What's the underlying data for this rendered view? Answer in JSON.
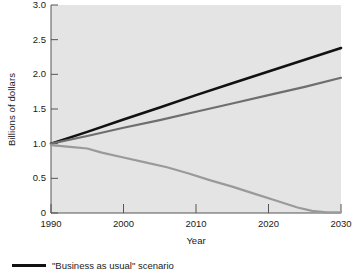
{
  "chart_data": {
    "type": "line",
    "title": "",
    "xlabel": "Year",
    "ylabel": "Billions of dollars",
    "xlim": [
      1990,
      2030
    ],
    "ylim": [
      0,
      3.0
    ],
    "xticks": [
      1990,
      2000,
      2010,
      2020,
      2030
    ],
    "xtick_labels": [
      "1990",
      "2000",
      "2010",
      "2020",
      "2030"
    ],
    "yticks": [
      0,
      0.5,
      1.0,
      1.5,
      2.0,
      2.5,
      3.0
    ],
    "ytick_labels": [
      "0",
      "0.5",
      "1.0",
      "1.5",
      "2.0",
      "2.5",
      "3.0"
    ],
    "grid": false,
    "legend_position": "below-plot",
    "plot_background": "#e4e4e4",
    "series": [
      {
        "name": "\"Business as usual\" scenario",
        "color": "#111111",
        "width": 2.6,
        "x": [
          1990,
          1995,
          2000,
          2005,
          2010,
          2015,
          2020,
          2025,
          2030
        ],
        "values": [
          1.0,
          1.17,
          1.35,
          1.52,
          1.7,
          1.87,
          2.04,
          2.21,
          2.38
        ]
      },
      {
        "name": "middle scenario",
        "color": "#6e6e6e",
        "width": 2.2,
        "x": [
          1990,
          1995,
          2000,
          2005,
          2010,
          2015,
          2020,
          2025,
          2030
        ],
        "values": [
          1.0,
          1.11,
          1.23,
          1.34,
          1.46,
          1.58,
          1.7,
          1.82,
          1.95
        ]
      },
      {
        "name": "declining scenario",
        "color": "#9a9a9a",
        "width": 2.2,
        "x": [
          1990,
          1993,
          1995,
          1997,
          2000,
          2003,
          2006,
          2009,
          2012,
          2015,
          2018,
          2021,
          2024,
          2026,
          2028,
          2030
        ],
        "values": [
          0.98,
          0.95,
          0.93,
          0.87,
          0.8,
          0.73,
          0.66,
          0.57,
          0.47,
          0.38,
          0.28,
          0.18,
          0.08,
          0.03,
          0.01,
          0.01
        ]
      }
    ]
  },
  "legend": {
    "entries": [
      {
        "label": "\"Business as usual\" scenario",
        "color": "#111111"
      }
    ]
  }
}
